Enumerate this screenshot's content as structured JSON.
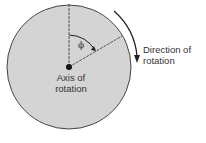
{
  "diagram": {
    "labels": {
      "axis_line1": "Axis of",
      "axis_line2": "rotation",
      "direction_line1": "Direction of",
      "direction_line2": "rotation",
      "angle_symbol": "ϕ"
    },
    "colors": {
      "disk_fill": "#d4d4d4",
      "stroke": "#333333",
      "text": "#333333"
    }
  }
}
